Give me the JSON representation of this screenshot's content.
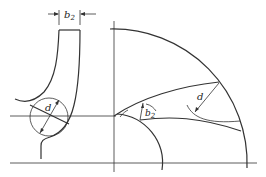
{
  "figure": {
    "labels": {
      "b2_top_main": "b",
      "b2_top_sub": "2",
      "d_left": "d",
      "b2_right_main": "b",
      "b2_right_sub": "2",
      "d_right": "d"
    },
    "colors": {
      "line": "#333333",
      "background": "#ffffff"
    }
  }
}
